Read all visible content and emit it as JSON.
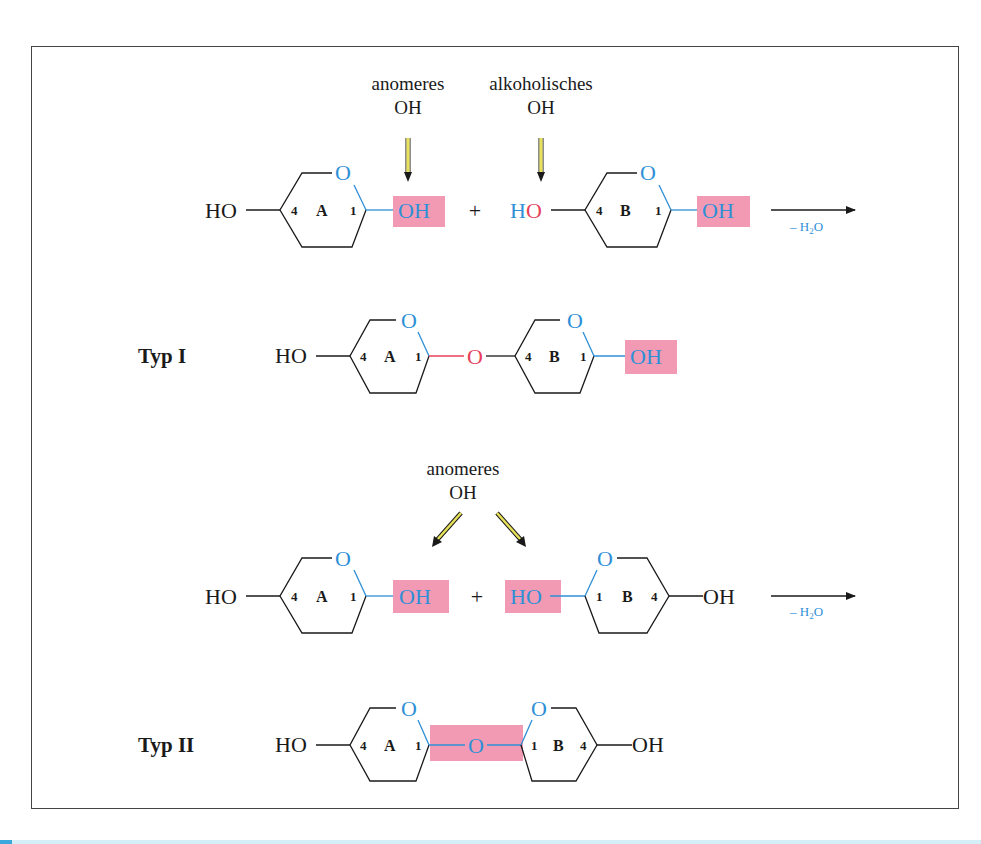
{
  "colors": {
    "ring_oxygen": "#2f8fd6",
    "glycosidic_oxygen_type1": "#e8405a",
    "highlight_box": "#f29ab4",
    "arrow_yellow": "#e8e25a",
    "text": "#1a1a1a"
  },
  "reaction1": {
    "label_anomeric": [
      "anomeres",
      "OH"
    ],
    "label_alcoholic": [
      "alkoholisches",
      "OH"
    ],
    "left_HO": "HO",
    "ring_a": {
      "name": "A",
      "c4": "4",
      "c1": "1",
      "ring_o": "O",
      "oh": "OH"
    },
    "plus": "+",
    "ring_b_HO_H": "H",
    "ring_b_HO_O": "O",
    "ring_b": {
      "name": "B",
      "c4": "4",
      "c1": "1",
      "ring_o": "O",
      "oh": "OH"
    },
    "arrow_label": "– H",
    "arrow_label_sub": "2",
    "arrow_label_end": "O"
  },
  "product1": {
    "title": "Typ I",
    "left_HO": "HO",
    "ring_a": {
      "name": "A",
      "c4": "4",
      "c1": "1",
      "ring_o": "O"
    },
    "bridge_o": "O",
    "ring_b": {
      "name": "B",
      "c4": "4",
      "c1": "1",
      "ring_o": "O",
      "oh": "OH"
    }
  },
  "reaction2": {
    "label_anomeric": [
      "anomeres",
      "OH"
    ],
    "left_HO": "HO",
    "ring_a": {
      "name": "A",
      "c4": "4",
      "c1": "1",
      "ring_o": "O",
      "oh": "OH"
    },
    "plus": "+",
    "ring_b": {
      "name": "B",
      "c4": "4",
      "c1": "1",
      "ring_o": "O",
      "ho": "HO",
      "right_oh": "OH"
    },
    "arrow_label": "– H",
    "arrow_label_sub": "2",
    "arrow_label_end": "O"
  },
  "product2": {
    "title": "Typ II",
    "left_HO": "HO",
    "ring_a": {
      "name": "A",
      "c4": "4",
      "c1": "1",
      "ring_o": "O"
    },
    "bridge_o": "O",
    "ring_b": {
      "name": "B",
      "c4": "4",
      "c1": "1",
      "ring_o": "O"
    },
    "right_oh": "OH"
  }
}
